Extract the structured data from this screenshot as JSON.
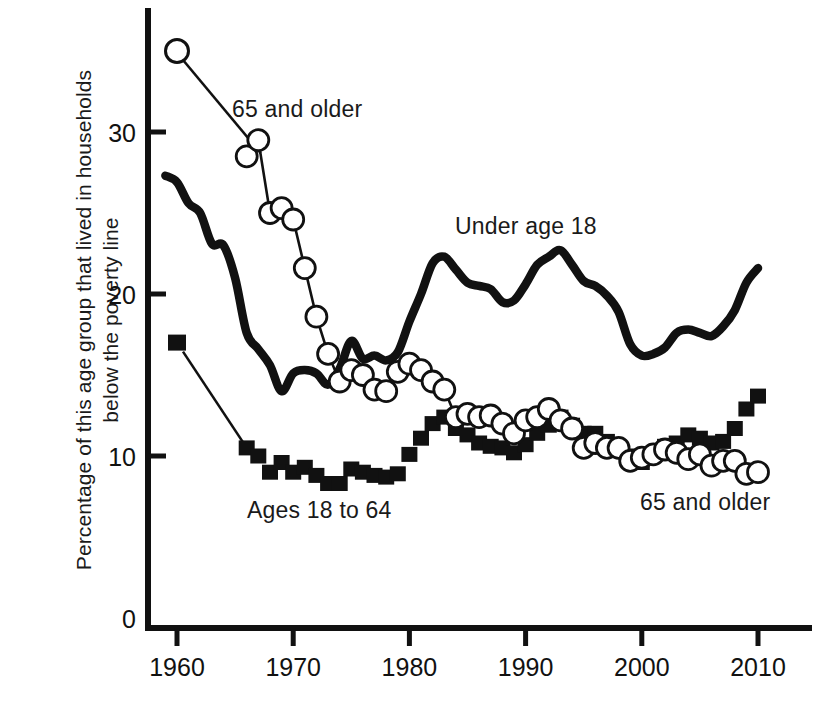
{
  "chart_data": {
    "type": "line",
    "title": "",
    "xlabel": "",
    "ylabel": "Percentage of this age group that lived in households below the poverty line",
    "xlim": [
      1958.5,
      2011.5
    ],
    "ylim": [
      0,
      36
    ],
    "xticks": [
      1960,
      1970,
      1980,
      1990,
      2000,
      2010
    ],
    "yticks": [
      0,
      10,
      20,
      30
    ],
    "grid": false,
    "legend": "inline annotations",
    "annotations": [
      {
        "id": "older-top",
        "text": "65 and older",
        "series": "65 and older",
        "x": 232,
        "y": 96
      },
      {
        "id": "under18",
        "text": "Under age 18",
        "series": "Under age 18",
        "x": 455,
        "y": 213
      },
      {
        "id": "ages1864",
        "text": "Ages 18 to 64",
        "series": "Ages 18 to 64",
        "x": 247,
        "y": 497
      },
      {
        "id": "older-bottom",
        "text": "65 and older",
        "series": "65 and older",
        "x": 640,
        "y": 489
      }
    ],
    "legend_markers": [
      {
        "id": "older-sample",
        "style": "open-circle",
        "x": 1960.0,
        "y": 35.0,
        "leader_to": [
          1967.2,
          28.7
        ]
      },
      {
        "id": "ages-sample",
        "style": "filled-square",
        "x": 1960.0,
        "y": 17.0,
        "leader_to": [
          1966.0,
          10.5
        ]
      }
    ],
    "series": [
      {
        "name": "Under age 18",
        "style": "thick-solid-line",
        "color": "#111111",
        "x": [
          1959,
          1960,
          1961,
          1962,
          1963,
          1964,
          1965,
          1966,
          1967,
          1968,
          1969,
          1970,
          1971,
          1972,
          1973,
          1974,
          1975,
          1976,
          1977,
          1978,
          1979,
          1980,
          1981,
          1982,
          1983,
          1984,
          1985,
          1986,
          1987,
          1988,
          1989,
          1990,
          1991,
          1992,
          1993,
          1994,
          1995,
          1996,
          1997,
          1998,
          1999,
          2000,
          2001,
          2002,
          2003,
          2004,
          2005,
          2006,
          2007,
          2008,
          2009,
          2010
        ],
        "values": [
          27.3,
          26.9,
          25.6,
          25.0,
          23.1,
          23.0,
          21.0,
          17.6,
          16.6,
          15.6,
          14.0,
          15.1,
          15.3,
          15.1,
          14.4,
          15.4,
          17.1,
          16.0,
          16.2,
          15.9,
          16.4,
          18.3,
          20.0,
          21.9,
          22.3,
          21.5,
          20.7,
          20.5,
          20.3,
          19.5,
          19.6,
          20.6,
          21.8,
          22.3,
          22.7,
          21.8,
          20.8,
          20.5,
          19.9,
          18.9,
          16.9,
          16.2,
          16.3,
          16.7,
          17.6,
          17.8,
          17.6,
          17.4,
          18.0,
          19.0,
          20.7,
          21.6
        ]
      },
      {
        "name": "Ages 18 to 64",
        "style": "filled-square-markers",
        "color": "#111111",
        "x": [
          1966,
          1967,
          1968,
          1969,
          1970,
          1971,
          1972,
          1973,
          1974,
          1975,
          1976,
          1977,
          1978,
          1979,
          1980,
          1981,
          1982,
          1983,
          1984,
          1985,
          1986,
          1987,
          1988,
          1989,
          1990,
          1991,
          1992,
          1993,
          1994,
          1995,
          1996,
          1997,
          1998,
          1999,
          2000,
          2001,
          2002,
          2003,
          2004,
          2005,
          2006,
          2007,
          2008,
          2009,
          2010
        ],
        "values": [
          10.5,
          10.0,
          9.0,
          9.6,
          9.0,
          9.3,
          8.8,
          8.3,
          8.3,
          9.2,
          9.0,
          8.8,
          8.7,
          8.9,
          10.1,
          11.1,
          12.0,
          12.4,
          11.7,
          11.3,
          10.8,
          10.6,
          10.5,
          10.2,
          10.7,
          11.4,
          11.9,
          12.4,
          11.9,
          11.4,
          11.4,
          10.9,
          10.5,
          10.0,
          9.6,
          10.1,
          10.6,
          10.8,
          11.3,
          11.1,
          10.8,
          10.9,
          11.7,
          12.9,
          13.7
        ]
      },
      {
        "name": "65 and older",
        "style": "open-circle-markers",
        "color": "#111111",
        "x": [
          1966,
          1967,
          1968,
          1969,
          1970,
          1971,
          1972,
          1973,
          1974,
          1975,
          1976,
          1977,
          1978,
          1979,
          1980,
          1981,
          1982,
          1983,
          1984,
          1985,
          1986,
          1987,
          1988,
          1989,
          1990,
          1991,
          1992,
          1993,
          1994,
          1995,
          1996,
          1997,
          1998,
          1999,
          2000,
          2001,
          2002,
          2003,
          2004,
          2005,
          2006,
          2007,
          2008,
          2009,
          2010
        ],
        "values": [
          28.5,
          29.5,
          25.0,
          25.3,
          24.6,
          21.6,
          18.6,
          16.3,
          14.6,
          15.3,
          15.0,
          14.1,
          14.0,
          15.2,
          15.7,
          15.3,
          14.6,
          14.1,
          12.4,
          12.6,
          12.4,
          12.5,
          12.0,
          11.4,
          12.2,
          12.4,
          12.9,
          12.2,
          11.7,
          10.5,
          10.8,
          10.5,
          10.5,
          9.7,
          9.9,
          10.1,
          10.4,
          10.2,
          9.8,
          10.1,
          9.4,
          9.7,
          9.7,
          8.9,
          9.0
        ]
      }
    ]
  },
  "axis": {
    "y_title": "Percentage of this age group that lived in households below the poverty line",
    "y_tick_labels": [
      "30",
      "20",
      "10",
      "0"
    ],
    "x_tick_labels": [
      "1960",
      "1970",
      "1980",
      "1990",
      "2000",
      "2010"
    ]
  },
  "annotations": {
    "older_top": "65 and older",
    "under18": "Under age 18",
    "ages_18_64": "Ages 18 to 64",
    "older_bottom": "65 and older"
  },
  "colors": {
    "ink": "#111111",
    "background": "#ffffff"
  }
}
